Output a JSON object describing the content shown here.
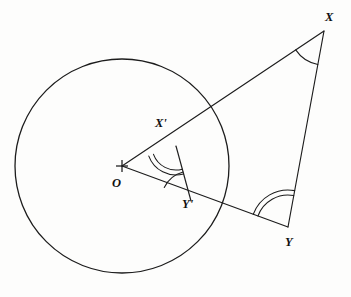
{
  "figure": {
    "background_color": "#fdfdfc",
    "stroke_color": "#1c1c1c",
    "width": 351,
    "height": 297
  },
  "labels": {
    "center": "O",
    "outer_x": "X",
    "outer_y": "Y",
    "inner_x": "X'",
    "inner_y": "Y'"
  },
  "geometry": {
    "circle": {
      "cx": 122,
      "cy": 166,
      "r": 107
    },
    "points": {
      "O": {
        "x": 122,
        "y": 166
      },
      "X": {
        "x": 324,
        "y": 31
      },
      "Y": {
        "x": 288,
        "y": 227
      },
      "Xp": {
        "x": 176,
        "y": 146
      },
      "Yp": {
        "x": 191,
        "y": 201
      }
    },
    "segments": [
      {
        "name": "O-to-X",
        "from": "O",
        "to": "X"
      },
      {
        "name": "O-to-Y",
        "from": "O",
        "to": "Y"
      },
      {
        "name": "Xp-to-Yp",
        "from": "Xp",
        "to": "Yp"
      },
      {
        "name": "X-to-Y",
        "from": "X",
        "to": "Y"
      }
    ],
    "angle_marks": [
      {
        "name": "angle-at-X",
        "vertex": "X",
        "arcs": 1
      },
      {
        "name": "angle-at-Y",
        "vertex": "Y",
        "arcs": 2
      },
      {
        "name": "angle-at-Xp",
        "vertex": "Xp",
        "arcs": 2
      },
      {
        "name": "angle-at-Yp",
        "vertex": "Yp",
        "arcs": 1
      }
    ],
    "center_marker": {
      "name": "plus-marker",
      "half_size": 6
    }
  }
}
